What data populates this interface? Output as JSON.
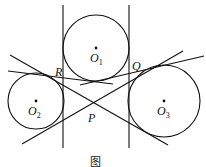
{
  "diagram": {
    "circles": [
      {
        "name": "O1",
        "label": "O",
        "sub": "1",
        "cx": 96,
        "cy": 48,
        "r": 33
      },
      {
        "name": "O2",
        "label": "O",
        "sub": "2",
        "cx": 36,
        "cy": 101,
        "r": 28
      },
      {
        "name": "O3",
        "label": "O",
        "sub": "3",
        "cx": 164,
        "cy": 101,
        "r": 36
      }
    ],
    "points": {
      "R": "R",
      "Q": "Q",
      "P": "P"
    },
    "caption": "图"
  }
}
